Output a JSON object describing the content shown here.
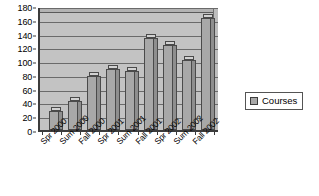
{
  "chart_data": {
    "type": "bar",
    "title": "",
    "subtitle": "",
    "xlabel": "",
    "ylabel": "",
    "categories": [
      "Spr 2000",
      "Sum 2000",
      "Fall 2000",
      "Spr 2001",
      "Sum 2001",
      "Fall 2001",
      "Spr 2002",
      "Sum 2002",
      "Fall 2002"
    ],
    "series": [
      {
        "name": "Courses",
        "values": [
          28,
          42,
          78,
          89,
          86,
          133,
          124,
          102,
          162
        ]
      }
    ],
    "ylim": [
      0,
      180
    ],
    "ytick_step": 20,
    "yticks": [
      0,
      20,
      40,
      60,
      80,
      100,
      120,
      140,
      160,
      180
    ],
    "ytick_labels": [
      "0",
      "20",
      "40",
      "60",
      "80",
      "100",
      "120",
      "140",
      "160",
      "180"
    ],
    "grid": true,
    "grid_axis": "y",
    "legend": true,
    "legend_position": "right",
    "legend_entries": [
      {
        "label": "Courses",
        "swatch_name": "legend-swatch-courses",
        "color": "#A8A8A8"
      }
    ],
    "style": "3d-column",
    "colors": {
      "plot_background": "#C3C3C3",
      "gridline": "#6A6A6A",
      "axis": "#3C3C3C",
      "bar_front": "#A8A8A8",
      "bar_side": "#8E8E8E",
      "bar_top": "#D2D2D2",
      "bar_border": "#4A4A4A",
      "figure_background": "#FFFFFF",
      "text": "#000000"
    }
  }
}
